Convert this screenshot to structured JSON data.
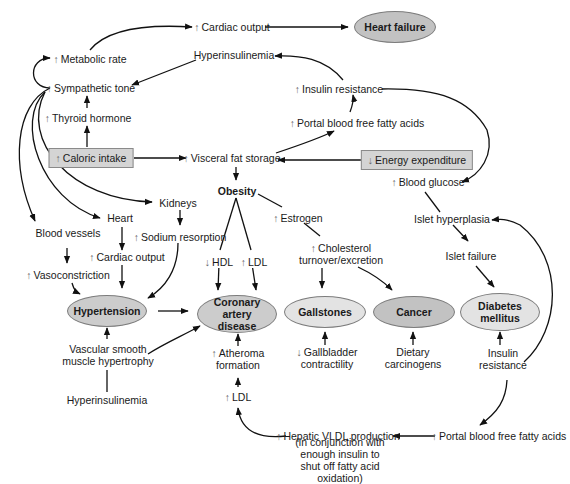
{
  "diagram": {
    "colors": {
      "ellipse_dark": "#c2c2c2",
      "ellipse_mid": "#cccccc",
      "ellipse_light": "#e3e3e3",
      "box": "#d4d4d4",
      "line": "#111111"
    },
    "up_arrow": "↑",
    "down_arrow": "↓",
    "nodes": {
      "cardiac_output_top": {
        "prefix": "↑",
        "text": "Cardiac output"
      },
      "heart_failure": {
        "text": "Heart failure"
      },
      "metabolic_rate": {
        "prefix": "↑",
        "text": "Metabolic rate"
      },
      "hyperinsulinemia_top": {
        "text": "Hyperinsulinemia"
      },
      "sympathetic_tone": {
        "prefix": "↑",
        "text": "Sympathetic tone"
      },
      "insulin_resistance_top": {
        "prefix": "↑",
        "text": "Insulin resistance"
      },
      "thyroid_hormone": {
        "prefix": "↑",
        "text": "Thyroid hormone"
      },
      "portal_ffa_top": {
        "prefix": "↑",
        "text": "Portal blood free fatty acids"
      },
      "caloric_intake": {
        "prefix": "↑",
        "text": "Caloric intake"
      },
      "visceral_fat": {
        "prefix": "↑",
        "text": "Visceral fat storage"
      },
      "energy_expenditure": {
        "prefix": "↓",
        "text": "Energy expenditure"
      },
      "kidneys": {
        "text": "Kidneys"
      },
      "obesity": {
        "text": "Obesity"
      },
      "blood_glucose": {
        "prefix": "↑",
        "text": "Blood glucose"
      },
      "heart": {
        "text": "Heart"
      },
      "estrogen": {
        "prefix": "↑",
        "text": "Estrogen"
      },
      "islet_hyperplasia": {
        "text": "Islet hyperplasia"
      },
      "blood_vessels": {
        "text": "Blood vessels"
      },
      "sodium_resorption": {
        "prefix": "↑",
        "text": "Sodium resorption"
      },
      "cholesterol_turnover": {
        "prefix": "↑",
        "text": "Cholesterol turnover/excretion"
      },
      "islet_failure": {
        "text": "Islet failure"
      },
      "cardiac_output_mid": {
        "prefix": "↑",
        "text": "Cardiac output"
      },
      "hdl": {
        "prefix": "↓",
        "text": "HDL"
      },
      "ldl_top": {
        "prefix": "↑",
        "text": "LDL"
      },
      "vasoconstriction": {
        "prefix": "↑",
        "text": "Vasoconstriction"
      },
      "hypertension": {
        "text": "Hypertension"
      },
      "coronary_artery_disease": {
        "text": "Coronary artery disease"
      },
      "gallstones": {
        "text": "Gallstones"
      },
      "cancer": {
        "text": "Cancer"
      },
      "diabetes_mellitus": {
        "text": "Diabetes mellitus"
      },
      "vascular_smooth_muscle": {
        "text": "Vascular smooth muscle hypertrophy"
      },
      "atheroma_formation": {
        "prefix": "↑",
        "text": "Atheroma formation"
      },
      "gallbladder_contractility": {
        "prefix": "↓",
        "text": "Gallbladder contractility"
      },
      "dietary_carcinogens": {
        "text": "Dietary carcinogens"
      },
      "insulin_resistance_bottom": {
        "text": "Insulin resistance"
      },
      "hyperinsulinemia_bottom": {
        "text": "Hyperinsulinemia"
      },
      "ldl_bottom": {
        "prefix": "↑",
        "text": "LDL"
      },
      "hepatic_vldl": {
        "prefix": "↑",
        "text": "Hepatic VLDL production"
      },
      "hepatic_vldl_note": {
        "text": "(in conjunction with enough insulin to shut off fatty acid oxidation)"
      },
      "portal_ffa_bottom": {
        "prefix": "↑",
        "text": "Portal blood free fatty acids"
      }
    }
  }
}
